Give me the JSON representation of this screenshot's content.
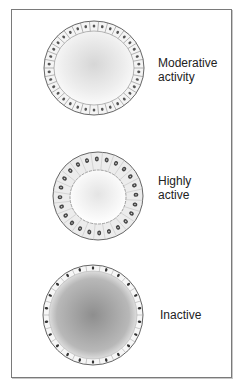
{
  "diagram": {
    "follicles": [
      {
        "id": "moderate",
        "label_lines": [
          "Moderative",
          "activity"
        ],
        "cx": 94,
        "cy": 68,
        "rx": 50,
        "ry": 47,
        "cell_count": 34,
        "epithelium": "cuboidal",
        "colloid": "#d8d8d8"
      },
      {
        "id": "high",
        "label_lines": [
          "Highly",
          "active"
        ],
        "cx": 98,
        "cy": 196,
        "rx": 45,
        "ry": 44,
        "cell_count": 24,
        "epithelium": "columnar",
        "colloid": "#ececec"
      },
      {
        "id": "inactive",
        "label_lines": [
          "Inactive"
        ],
        "cx": 93,
        "cy": 315,
        "rx": 50,
        "ry": 50,
        "cell_count": 22,
        "epithelium": "flattened",
        "colloid": "#9a9a9a"
      }
    ],
    "labels": {
      "moderate_1": "Moderative",
      "moderate_2": "activity",
      "high_1": "Highly",
      "high_2": "active",
      "inactive": "Inactive"
    }
  }
}
